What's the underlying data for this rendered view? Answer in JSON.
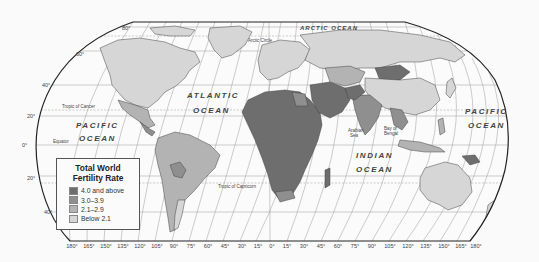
{
  "title": "Total World Fertility Rate",
  "legend": {
    "title_line1": "Total World",
    "title_line2": "Fertility Rate",
    "items": [
      {
        "label": "4.0 and above",
        "color": "#6e6e6e"
      },
      {
        "label": "3.0–3.9",
        "color": "#8f8f8f"
      },
      {
        "label": "2.1–2.9",
        "color": "#b3b3b3"
      },
      {
        "label": "Below 2.1",
        "color": "#d6d6d6"
      }
    ]
  },
  "oceans": {
    "atlantic_1": "ATLANTIC",
    "atlantic_2": "OCEAN",
    "pacific_w_1": "PACIFIC",
    "pacific_w_2": "OCEAN",
    "pacific_e_1": "PACIFIC",
    "pacific_e_2": "OCEAN",
    "indian_1": "INDIAN",
    "indian_2": "OCEAN",
    "arctic": "ARCTIC OCEAN"
  },
  "seas": {
    "arabian_1": "Arabian",
    "arabian_2": "Sea",
    "bengal_1": "Bay of",
    "bengal_2": "Bengal"
  },
  "lines": {
    "arctic_circle": "Arctic Circle",
    "tropic_cancer": "Tropic of Cancer",
    "equator": "Equator",
    "tropic_capricorn": "Tropic of Capricorn"
  },
  "latitude_labels": {
    "lat80": "80°",
    "lat60": "60°",
    "lat40n": "40°",
    "lat20n": "20°",
    "lat0": "0°",
    "lat20s": "20°",
    "lat40s": "40°"
  },
  "longitude_labels": [
    "180°",
    "165°",
    "150°",
    "135°",
    "120°",
    "105°",
    "90°",
    "75°",
    "60°",
    "45°",
    "30°",
    "15°",
    "0°",
    "15°",
    "30°",
    "45°",
    "60°",
    "75°",
    "90°",
    "105°",
    "120°",
    "135°",
    "150°",
    "165°",
    "180°"
  ],
  "colors": {
    "high": "#6e6e6e",
    "mid": "#8f8f8f",
    "low": "#b3b3b3",
    "below": "#d6d6d6",
    "ocean": "#fafafa",
    "border": "#222222"
  }
}
